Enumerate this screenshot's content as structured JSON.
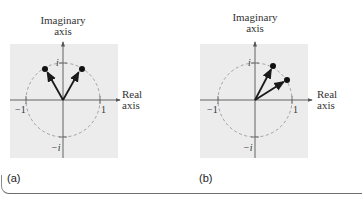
{
  "figure": {
    "panels": [
      {
        "id": "a",
        "label": "(a)",
        "y_axis_title_line1": "Imaginary",
        "y_axis_title_line2": "axis",
        "x_axis_title_line1": "Real",
        "x_axis_title_line2": "axis",
        "tick_labels": {
          "top": "i",
          "bottom": "−i",
          "left": "−1",
          "right": "1"
        },
        "vectors": [
          {
            "name": "vector-1",
            "angle_deg": 120
          },
          {
            "name": "vector-2",
            "angle_deg": 60
          }
        ]
      },
      {
        "id": "b",
        "label": "(b)",
        "y_axis_title_line1": "Imaginary",
        "y_axis_title_line2": "axis",
        "x_axis_title_line1": "Real",
        "x_axis_title_line2": "axis",
        "tick_labels": {
          "top": "i",
          "bottom": "−i",
          "left": "−1",
          "right": "1"
        },
        "vectors": [
          {
            "name": "vector-1",
            "angle_deg": 60
          },
          {
            "name": "vector-2",
            "angle_deg": 30
          }
        ]
      }
    ],
    "colors": {
      "plot_background": "#ececec",
      "axis": "#555555",
      "circle": "#999999",
      "vector": "#1a1a1a"
    }
  }
}
